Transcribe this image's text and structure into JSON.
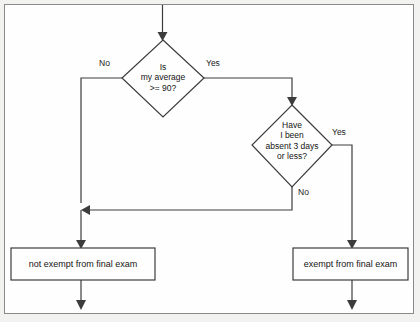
{
  "diagram": {
    "type": "flowchart",
    "colors": {
      "page_background": "#f2f2f0",
      "canvas_background": "#fefefe",
      "frame_border": "#8a8a8a",
      "line": "#3c3c3c",
      "text": "#141414"
    },
    "start": {
      "label": "",
      "arrow_name": "entry-arrow"
    },
    "decisions": [
      {
        "id": "decision-average",
        "text": "Is\nmy average\n>= 90?",
        "lines": [
          "Is",
          "my average",
          ">= 90?"
        ],
        "branch_no": "No",
        "branch_yes": "Yes"
      },
      {
        "id": "decision-absences",
        "text": "Have\nI been\nabsent 3 days\nor less?",
        "lines": [
          "Have",
          "I been",
          "absent 3 days",
          "or less?"
        ],
        "branch_yes": "Yes",
        "branch_no": "No"
      }
    ],
    "terminals": [
      {
        "id": "outcome-not-exempt",
        "text": "not exempt from final exam"
      },
      {
        "id": "outcome-exempt",
        "text": "exempt from final exam"
      }
    ]
  }
}
